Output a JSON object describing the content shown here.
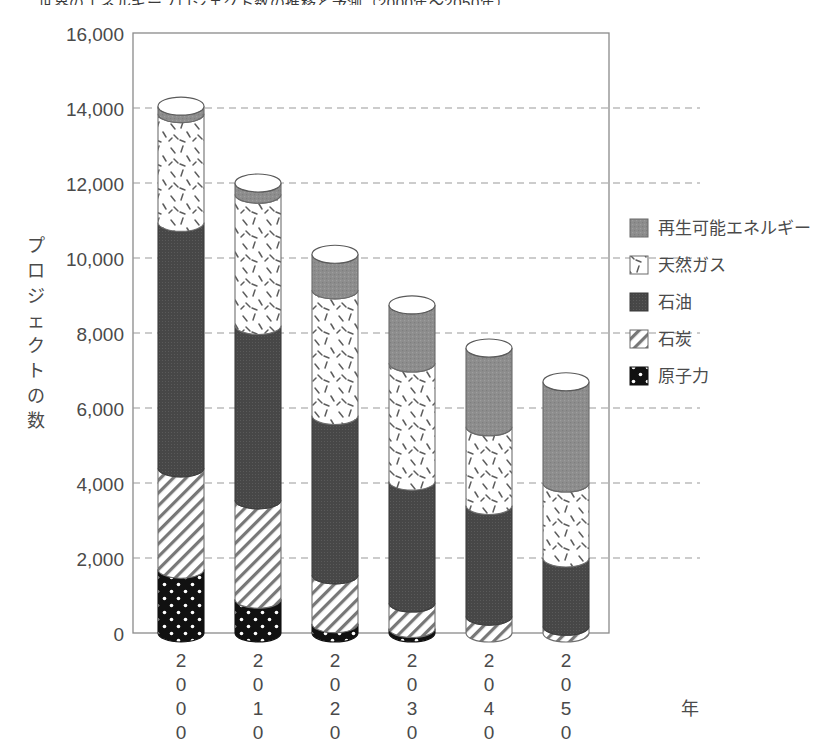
{
  "title_clipped": "世界のエネルギープロジェクト数の推移と予測（2000年〜2050年）",
  "axes": {
    "y_label": "プロジェクトの数",
    "y_label_chars": [
      "プ",
      "ロ",
      "ジ",
      "ェ",
      "ク",
      "ト",
      "の",
      "数"
    ],
    "y_ticks": [
      "0",
      "2,000",
      "4,000",
      "6,000",
      "8,000",
      "10,000",
      "12,000",
      "14,000",
      "16,000"
    ],
    "x_label": "年",
    "x_categories": [
      "2000",
      "2010",
      "2020",
      "2030",
      "2040",
      "2050"
    ]
  },
  "legend": {
    "items": [
      {
        "label": "再生可能エネルギー",
        "swatch": "gray-solid",
        "color": "#8f8f8f"
      },
      {
        "label": "天然ガス",
        "swatch": "white-dash-speckle",
        "color": "#ffffff"
      },
      {
        "label": "石油",
        "swatch": "dark-gray-solid",
        "color": "#4a4a4a"
      },
      {
        "label": "石炭",
        "swatch": "diagonal-hatch",
        "color": "#ffffff"
      },
      {
        "label": "原子力",
        "swatch": "black-dots",
        "color": "#111111"
      }
    ]
  },
  "chart_data": {
    "type": "bar",
    "stacked": true,
    "title": "世界のエネルギープロジェクト数の推移と予測（2000年〜2050年）",
    "xlabel": "年",
    "ylabel": "プロジェクトの数",
    "categories": [
      "2000",
      "2010",
      "2020",
      "2030",
      "2040",
      "2050"
    ],
    "ylim": [
      0,
      16000
    ],
    "ytick_step": 2000,
    "grid": "horizontal-dashed",
    "legend_position": "right",
    "series": [
      {
        "name": "原子力",
        "values": [
          1700,
          900,
          250,
          120,
          0,
          0
        ]
      },
      {
        "name": "石炭",
        "values": [
          2700,
          2650,
          1300,
          680,
          450,
          180
        ]
      },
      {
        "name": "石油",
        "values": [
          6550,
          4650,
          4250,
          3250,
          2950,
          1820
        ]
      },
      {
        "name": "天然ガス",
        "values": [
          2900,
          3500,
          3350,
          3150,
          2100,
          2000
        ]
      },
      {
        "name": "再生可能エネルギー",
        "values": [
          200,
          300,
          950,
          1550,
          2100,
          2700
        ]
      }
    ],
    "totals": [
      14050,
      12000,
      10100,
      8750,
      7600,
      6700
    ]
  }
}
